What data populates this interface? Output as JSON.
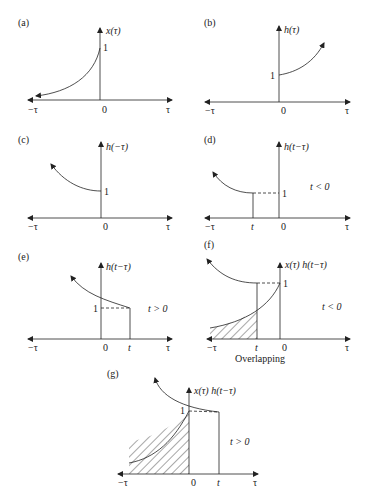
{
  "figure": {
    "panels": [
      {
        "id": "a",
        "label": "(a)",
        "ylabel": "x(τ)",
        "one": "1",
        "zero": "0",
        "neg": "−τ",
        "pos": "τ"
      },
      {
        "id": "b",
        "label": "(b)",
        "ylabel": "h(τ)",
        "one": "1",
        "zero": "0",
        "neg": "−τ",
        "pos": "τ"
      },
      {
        "id": "c",
        "label": "(c)",
        "ylabel": "h(−τ)",
        "one": "1",
        "zero": "0",
        "neg": "−τ",
        "pos": "τ"
      },
      {
        "id": "d",
        "label": "(d)",
        "ylabel": "h(t−τ)",
        "one": "1",
        "zero": "0",
        "neg": "−τ",
        "pos": "τ",
        "t": "t",
        "condition": "t < 0"
      },
      {
        "id": "e",
        "label": "(e)",
        "ylabel": "h(t−τ)",
        "one": "1",
        "zero": "0",
        "neg": "−τ",
        "pos": "τ",
        "t": "t",
        "condition": "t > 0"
      },
      {
        "id": "f",
        "label": "(f)",
        "ylabel": "x(τ) h(t−τ)",
        "one": "1",
        "zero": "0",
        "neg": "−τ",
        "pos": "τ",
        "t": "t",
        "condition": "t < 0",
        "caption": "Overlapping"
      },
      {
        "id": "g",
        "label": "(g)",
        "ylabel": "x(τ) h(t−τ)",
        "one": "1",
        "zero": "0",
        "neg": "−τ",
        "pos": "τ",
        "t": "t",
        "condition": "t > 0"
      }
    ]
  }
}
